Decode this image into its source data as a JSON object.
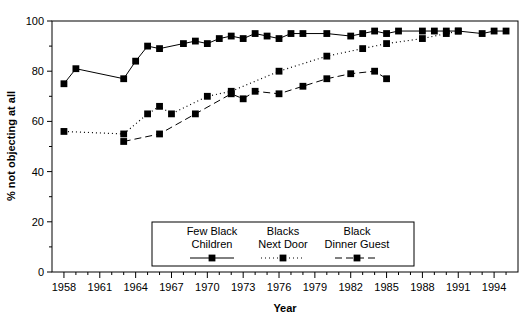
{
  "chart_data": {
    "type": "line",
    "title": "",
    "xlabel": "Year",
    "ylabel": "% not objecting at all",
    "xlim": [
      1957,
      1996
    ],
    "ylim": [
      0,
      100
    ],
    "grid": false,
    "legend_position": "bottom-center",
    "xticks_major": [
      1958,
      1961,
      1964,
      1967,
      1970,
      1973,
      1976,
      1979,
      1982,
      1985,
      1988,
      1991,
      1994
    ],
    "xticks_minor_step": 1,
    "yticks": [
      0,
      20,
      40,
      60,
      80,
      100
    ],
    "marker": "filled-square",
    "series": [
      {
        "name": "Few Black Children",
        "legend_label_line1": "Few Black",
        "legend_label_line2": "Children",
        "linestyle": "solid",
        "color": "#000000",
        "x": [
          1958,
          1959,
          1963,
          1964,
          1965,
          1966,
          1968,
          1969,
          1970,
          1971,
          1972,
          1973,
          1974,
          1975,
          1976,
          1977,
          1978,
          1980,
          1982,
          1983,
          1984,
          1985,
          1986,
          1988,
          1989,
          1990,
          1991,
          1993,
          1994,
          1995
        ],
        "y": [
          75,
          81,
          77,
          84,
          90,
          89,
          91,
          92,
          91,
          93,
          94,
          93,
          95,
          94,
          93,
          95,
          95,
          95,
          94,
          95,
          96,
          95,
          96,
          96,
          96,
          96,
          96,
          95,
          96,
          96
        ]
      },
      {
        "name": "Blacks Next Door",
        "legend_label_line1": "Blacks",
        "legend_label_line2": "Next Door",
        "linestyle": "dotted",
        "color": "#000000",
        "x": [
          1958,
          1963,
          1965,
          1966,
          1967,
          1970,
          1972,
          1976,
          1980,
          1983,
          1985,
          1988,
          1990,
          1991
        ],
        "y": [
          56,
          55,
          63,
          66,
          63,
          70,
          72,
          80,
          86,
          89,
          91,
          93,
          95,
          96
        ]
      },
      {
        "name": "Black Dinner Guest",
        "legend_label_line1": "Black",
        "legend_label_line2": "Dinner Guest",
        "linestyle": "dashed",
        "color": "#000000",
        "x": [
          1963,
          1966,
          1969,
          1972,
          1973,
          1974,
          1976,
          1978,
          1980,
          1982,
          1984,
          1985
        ],
        "y": [
          52,
          55,
          63,
          71,
          69,
          72,
          71,
          74,
          77,
          79,
          80,
          77
        ]
      }
    ]
  },
  "legend": {
    "entries": [
      {
        "line1": "Few Black",
        "line2": "Children",
        "style": "solid"
      },
      {
        "line1": "Blacks",
        "line2": "Next Door",
        "style": "dotted"
      },
      {
        "line1": "Black",
        "line2": "Dinner Guest",
        "style": "dashed"
      }
    ]
  },
  "axes": {
    "x_title": "Year",
    "y_title": "% not objecting at all"
  }
}
